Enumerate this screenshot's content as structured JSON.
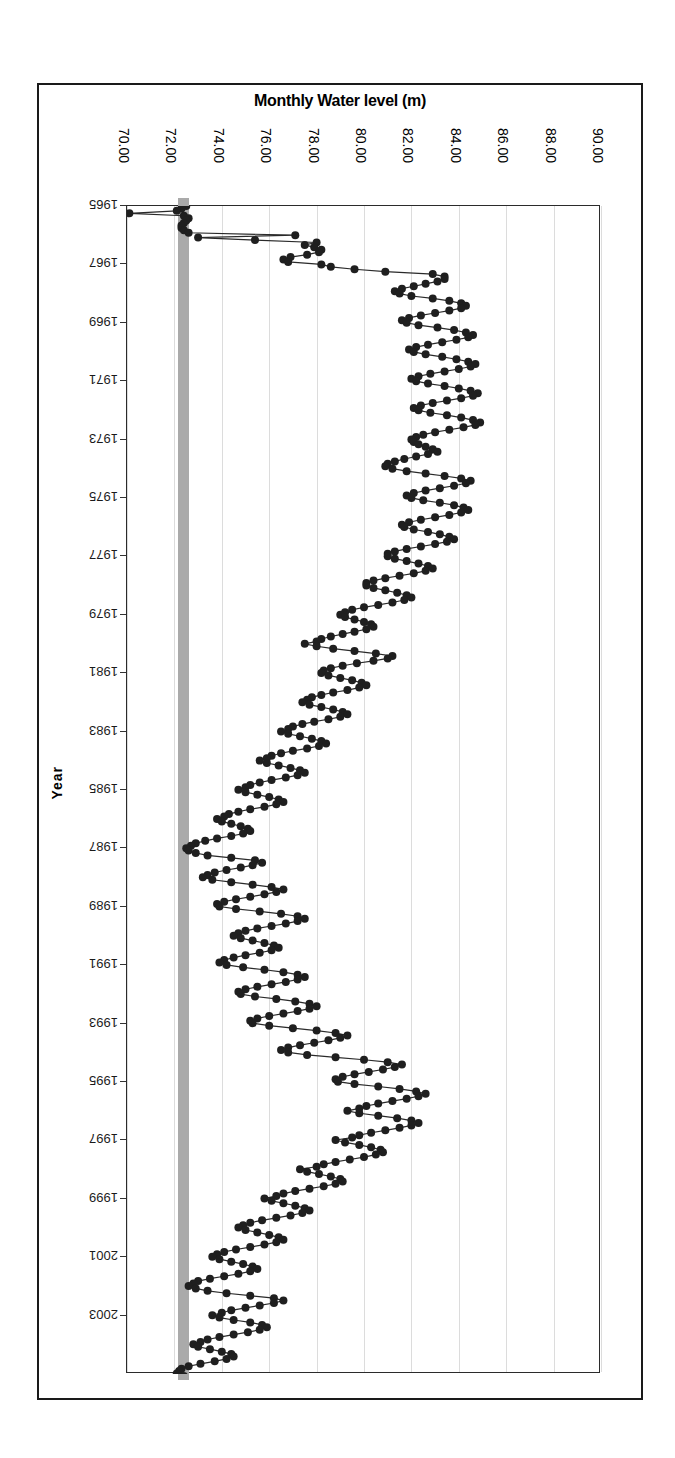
{
  "page": {
    "cutoff_header_text": ""
  },
  "chart_data": {
    "type": "line",
    "title": "Monthly Water level (m)",
    "xlabel": "Monthly Water level (m)",
    "ylabel": "Year",
    "orientation": "horizontal-value-vertical-time",
    "grid": true,
    "legend": "none",
    "xlim": [
      70.0,
      90.0
    ],
    "xticks": [
      "70.00",
      "72.00",
      "74.00",
      "76.00",
      "78.00",
      "80.00",
      "82.00",
      "84.00",
      "86.00",
      "88.00",
      "90.00"
    ],
    "xtick_values": [
      70,
      72,
      74,
      76,
      78,
      80,
      82,
      84,
      86,
      88,
      90
    ],
    "ylim": [
      1965,
      2004
    ],
    "yticks": [
      "1965",
      "1967",
      "1969",
      "1971",
      "1973",
      "1975",
      "1977",
      "1979",
      "1981",
      "1983",
      "1985",
      "1987",
      "1989",
      "1991",
      "1993",
      "1995",
      "1997",
      "1999",
      "2001",
      "2003"
    ],
    "ytick_values": [
      1965,
      1967,
      1969,
      1971,
      1973,
      1975,
      1977,
      1979,
      1981,
      1983,
      1985,
      1987,
      1989,
      1991,
      1993,
      1995,
      1997,
      1999,
      2001,
      2003
    ],
    "reference_band": {
      "label": "low-level reference band",
      "color": "#aaaaaa",
      "x_from": 72.15,
      "x_to": 72.62
    },
    "marker": {
      "shape": "circle",
      "color": "#1f1f1f",
      "size": 4
    },
    "line": {
      "color": "#2a2a2a",
      "width": 1.2
    },
    "series": [
      {
        "name": "Monthly water level",
        "x": [
          72.5,
          72.3,
          72.1,
          70.1,
          72.4,
          72.6,
          72.5,
          72.4,
          72.3,
          72.3,
          72.4,
          72.6,
          77.1,
          73.0,
          75.4,
          78.0,
          77.5,
          77.9,
          78.2,
          78.1,
          77.6,
          76.9,
          76.6,
          76.8,
          78.2,
          78.6,
          79.6,
          80.9,
          82.9,
          83.4,
          83.4,
          83.1,
          82.6,
          82.1,
          81.6,
          81.3,
          81.5,
          82.0,
          82.9,
          83.6,
          84.1,
          84.3,
          84.1,
          83.6,
          83.0,
          82.4,
          81.9,
          81.6,
          81.8,
          82.3,
          83.1,
          83.8,
          84.3,
          84.6,
          84.4,
          83.9,
          83.3,
          82.7,
          82.2,
          81.9,
          82.1,
          82.6,
          83.3,
          83.9,
          84.4,
          84.7,
          84.5,
          84.0,
          83.4,
          82.8,
          82.3,
          82.0,
          82.2,
          82.7,
          83.4,
          84.0,
          84.5,
          84.8,
          84.6,
          84.1,
          83.5,
          82.9,
          82.4,
          82.1,
          82.3,
          82.8,
          83.5,
          84.1,
          84.6,
          84.9,
          84.7,
          84.2,
          83.6,
          83.0,
          82.5,
          82.2,
          82.0,
          82.1,
          82.3,
          82.6,
          82.9,
          83.1,
          82.7,
          82.2,
          81.7,
          81.3,
          81.0,
          80.9,
          81.2,
          81.8,
          82.6,
          83.4,
          84.1,
          84.5,
          84.3,
          83.8,
          83.2,
          82.6,
          82.1,
          81.8,
          82.0,
          82.5,
          83.2,
          83.8,
          84.2,
          84.4,
          84.1,
          83.6,
          83.0,
          82.4,
          81.9,
          81.6,
          81.7,
          82.1,
          82.7,
          83.2,
          83.6,
          83.8,
          83.5,
          83.0,
          82.4,
          81.8,
          81.3,
          81.0,
          81.0,
          81.3,
          81.8,
          82.3,
          82.7,
          82.9,
          82.6,
          82.1,
          81.5,
          80.9,
          80.4,
          80.1,
          80.1,
          80.4,
          80.9,
          81.4,
          81.8,
          82.0,
          81.7,
          81.2,
          80.6,
          80.0,
          79.5,
          79.2,
          79.0,
          79.2,
          79.6,
          80.0,
          80.3,
          80.4,
          80.1,
          79.6,
          79.1,
          78.6,
          78.2,
          78.0,
          77.5,
          78.0,
          78.7,
          79.6,
          80.5,
          81.2,
          81.0,
          80.4,
          79.7,
          79.1,
          78.6,
          78.3,
          78.2,
          78.5,
          79.0,
          79.5,
          79.9,
          80.1,
          79.8,
          79.3,
          78.7,
          78.2,
          77.8,
          77.6,
          77.4,
          77.7,
          78.2,
          78.7,
          79.1,
          79.3,
          79.0,
          78.5,
          77.9,
          77.4,
          77.0,
          76.8,
          76.5,
          76.8,
          77.3,
          77.8,
          78.2,
          78.4,
          78.1,
          77.6,
          77.0,
          76.5,
          76.1,
          75.9,
          75.6,
          75.9,
          76.4,
          76.9,
          77.3,
          77.5,
          77.2,
          76.7,
          76.1,
          75.6,
          75.2,
          75.0,
          74.7,
          75.0,
          75.5,
          76.0,
          76.4,
          76.6,
          76.3,
          75.8,
          75.2,
          74.7,
          74.3,
          74.1,
          73.8,
          74.0,
          74.4,
          74.8,
          75.1,
          75.2,
          74.9,
          74.4,
          73.8,
          73.3,
          72.9,
          72.7,
          72.5,
          72.6,
          72.9,
          73.4,
          74.4,
          75.4,
          75.7,
          75.3,
          74.8,
          74.2,
          73.7,
          73.4,
          73.2,
          73.6,
          74.4,
          75.3,
          76.1,
          76.6,
          76.3,
          75.8,
          75.2,
          74.6,
          74.1,
          73.8,
          73.9,
          74.6,
          75.6,
          76.5,
          77.2,
          77.5,
          77.2,
          76.7,
          76.1,
          75.5,
          75.0,
          74.7,
          74.5,
          74.8,
          75.3,
          75.8,
          76.2,
          76.4,
          76.1,
          75.6,
          75.0,
          74.5,
          74.1,
          73.9,
          74.2,
          74.9,
          75.8,
          76.6,
          77.2,
          77.5,
          77.2,
          76.7,
          76.1,
          75.5,
          75.0,
          74.7,
          74.8,
          75.4,
          76.3,
          77.1,
          77.7,
          78.0,
          77.7,
          77.2,
          76.6,
          76.0,
          75.5,
          75.2,
          75.3,
          76.0,
          77.0,
          78.0,
          78.8,
          79.3,
          79.0,
          78.5,
          77.9,
          77.3,
          76.8,
          76.5,
          76.8,
          77.6,
          78.8,
          80.0,
          81.0,
          81.6,
          81.3,
          80.8,
          80.2,
          79.6,
          79.1,
          78.8,
          78.9,
          79.6,
          80.6,
          81.5,
          82.2,
          82.6,
          82.3,
          81.8,
          81.2,
          80.6,
          80.1,
          79.8,
          79.3,
          79.8,
          80.6,
          81.4,
          82.0,
          82.3,
          82.0,
          81.5,
          80.9,
          80.3,
          79.8,
          79.5,
          78.8,
          79.2,
          79.8,
          80.3,
          80.7,
          80.8,
          80.5,
          80.0,
          79.4,
          78.8,
          78.3,
          78.0,
          77.3,
          77.6,
          78.1,
          78.6,
          79.0,
          79.1,
          78.8,
          78.3,
          77.7,
          77.1,
          76.6,
          76.3,
          75.8,
          76.1,
          76.6,
          77.1,
          77.5,
          77.7,
          77.4,
          76.9,
          76.3,
          75.7,
          75.2,
          74.9,
          74.7,
          75.0,
          75.5,
          76.0,
          76.4,
          76.6,
          76.3,
          75.8,
          75.2,
          74.6,
          74.1,
          73.8,
          73.6,
          73.9,
          74.4,
          74.9,
          75.3,
          75.5,
          75.2,
          74.7,
          74.1,
          73.5,
          73.0,
          72.8,
          72.6,
          72.9,
          73.4,
          74.2,
          75.2,
          76.2,
          76.6,
          76.2,
          75.6,
          75.0,
          74.4,
          74.0,
          73.6,
          73.9,
          74.5,
          75.2,
          75.7,
          75.9,
          75.6,
          75.1,
          74.5,
          73.9,
          73.4,
          73.1,
          72.8,
          73.0,
          73.5,
          74.0,
          74.4,
          74.5,
          74.2,
          73.7,
          73.1,
          72.6,
          72.3,
          72.2,
          72.1,
          72.4,
          73.0,
          73.9,
          75.0,
          75.6,
          75.4,
          75.0,
          74.5,
          74.0,
          73.6,
          73.4
        ],
        "y_start_year": 1965.0,
        "y_step_years": 0.0833
      }
    ]
  }
}
